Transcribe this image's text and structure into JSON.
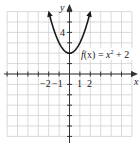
{
  "chart_data": {
    "type": "line",
    "title": "",
    "function_label": "f(x) = x² + 2",
    "xlabel": "x",
    "ylabel": "y",
    "xlim": [
      -6,
      6
    ],
    "ylim": [
      -6,
      6
    ],
    "grid": true,
    "x_tick_labels": [
      "−2",
      "−1",
      "1",
      "2"
    ],
    "y_tick_labels": [
      "4"
    ],
    "series": [
      {
        "name": "f(x) = x^2 + 2",
        "x": [
          -2,
          -1.5,
          -1,
          -0.5,
          0,
          0.5,
          1,
          1.5,
          2
        ],
        "values": [
          6,
          4.25,
          3,
          2.25,
          2,
          2.25,
          3,
          4.25,
          6
        ]
      }
    ]
  },
  "labels": {
    "x_axis": "x",
    "y_axis": "y",
    "y_tick_4": "4",
    "x_tick_m2": "−2",
    "x_tick_m1": "−1",
    "x_tick_1": "1",
    "x_tick_2": "2",
    "fx_prefix": "f(x) = x",
    "fx_exp": "2",
    "fx_suffix": " + 2"
  }
}
